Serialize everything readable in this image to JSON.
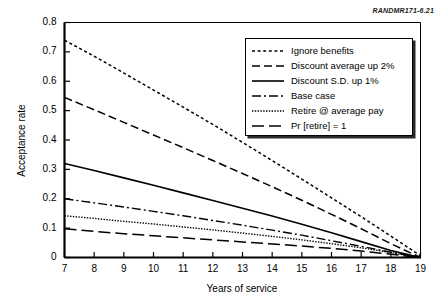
{
  "figure": {
    "source_id": "RANDMR171-6.21",
    "background_color": "#ffffff",
    "line_color": "#000000"
  },
  "chart_data": {
    "type": "line",
    "title": "",
    "xlabel": "Years of service",
    "ylabel": "Acceptance rate",
    "xlim": [
      7,
      19
    ],
    "ylim": [
      0,
      0.8
    ],
    "xticks": [
      7,
      8,
      9,
      10,
      11,
      12,
      13,
      14,
      15,
      16,
      17,
      18,
      19
    ],
    "xtick_labels": [
      "7",
      "8",
      "9",
      "10",
      "11",
      "12",
      "13",
      "14",
      "15",
      "16",
      "17",
      "18",
      "19"
    ],
    "yticks": [
      0,
      0.1,
      0.2,
      0.3,
      0.4,
      0.5,
      0.6,
      0.7,
      0.8
    ],
    "ytick_labels": [
      "0",
      "0.1",
      "0.2",
      "0.3",
      "0.4",
      "0.5",
      "0.6",
      "0.7",
      "0.8"
    ],
    "grid": false,
    "legend_position": "upper right",
    "x": [
      7,
      8,
      9,
      10,
      11,
      12,
      13,
      14,
      15,
      16,
      17,
      18,
      19
    ],
    "series": [
      {
        "name": "Ignore benefits",
        "dash": "dotted-short",
        "dasharray": "3,2.6",
        "width": 1.5,
        "values": [
          0.74,
          0.685,
          0.628,
          0.57,
          0.512,
          0.453,
          0.392,
          0.33,
          0.267,
          0.203,
          0.139,
          0.073,
          0.006
        ]
      },
      {
        "name": "Discount average up 2%",
        "dash": "dashed",
        "dasharray": "8,4",
        "width": 1.5,
        "values": [
          0.545,
          0.503,
          0.46,
          0.417,
          0.374,
          0.33,
          0.286,
          0.241,
          0.195,
          0.147,
          0.098,
          0.047,
          0.0
        ]
      },
      {
        "name": "Discount S.D. up 1%",
        "dash": "solid",
        "dasharray": "",
        "width": 1.6,
        "values": [
          0.32,
          0.296,
          0.271,
          0.246,
          0.22,
          0.194,
          0.168,
          0.141,
          0.113,
          0.084,
          0.054,
          0.024,
          0.0
        ]
      },
      {
        "name": "Base case",
        "dash": "dash-dot",
        "dasharray": "9,3,2,3",
        "width": 1.4,
        "values": [
          0.2,
          0.186,
          0.172,
          0.157,
          0.142,
          0.126,
          0.11,
          0.093,
          0.076,
          0.057,
          0.038,
          0.018,
          0.0
        ]
      },
      {
        "name": "Retire @ average pay",
        "dash": "dotted-fine",
        "dasharray": "1.4,1.4",
        "width": 1.4,
        "values": [
          0.142,
          0.133,
          0.123,
          0.114,
          0.104,
          0.094,
          0.083,
          0.072,
          0.06,
          0.047,
          0.033,
          0.017,
          0.0
        ]
      },
      {
        "name": "Pr [retire] = 1",
        "dash": "long-dash",
        "dasharray": "12,5",
        "width": 1.5,
        "values": [
          0.098,
          0.089,
          0.081,
          0.074,
          0.067,
          0.06,
          0.053,
          0.046,
          0.039,
          0.031,
          0.022,
          0.011,
          0.0
        ]
      }
    ]
  }
}
